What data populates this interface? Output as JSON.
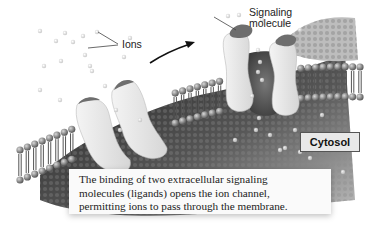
{
  "diagram": {
    "labels": {
      "ions": "Ions",
      "signaling_molecule_line1": "Signaling",
      "signaling_molecule_line2": "molecule",
      "cytosol": "Cytosol"
    },
    "caption": {
      "lines": [
        "The binding of two extracellular signaling",
        "molecules (ligands) opens the ion channel,",
        "permitting ions to pass through the membrane."
      ]
    },
    "states": [
      {
        "name": "closed-channel",
        "description": "Ion channel closed, no ligands bound"
      },
      {
        "name": "open-channel",
        "description": "Two signaling molecules bound, channel open with ions passing"
      }
    ],
    "colors": {
      "background": "#ffffff",
      "membrane_head": "#8a8a8a",
      "membrane_tail": "#5a5a5a",
      "cytosol_dark": "#2a2a2a",
      "protein": "#e4e4e4",
      "ligand": "#6e6e6e",
      "ion": "#cfcfcf",
      "caption_bg": "#fafafa"
    }
  }
}
